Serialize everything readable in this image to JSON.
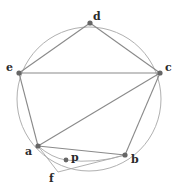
{
  "diagram": {
    "circle": {
      "cx": 89,
      "cy": 99,
      "r": 72
    },
    "points": [
      {
        "id": "d",
        "label": "d",
        "x": 90,
        "y": 23,
        "lx": 93,
        "ly": 20
      },
      {
        "id": "e",
        "label": "e",
        "x": 19,
        "y": 73,
        "lx": 6,
        "ly": 71
      },
      {
        "id": "c",
        "label": "c",
        "x": 160,
        "y": 73,
        "lx": 165,
        "ly": 71
      },
      {
        "id": "a",
        "label": "a",
        "x": 38,
        "y": 146,
        "lx": 25,
        "ly": 155
      },
      {
        "id": "b",
        "label": "b",
        "x": 125,
        "y": 155,
        "lx": 131,
        "ly": 163
      },
      {
        "id": "p",
        "label": "p",
        "x": 66,
        "y": 160,
        "lx": 71,
        "ly": 161
      },
      {
        "id": "f",
        "label": "f",
        "x": 58,
        "y": 172,
        "lx": 49,
        "ly": 182
      }
    ],
    "segments": [
      [
        "e",
        "d"
      ],
      [
        "d",
        "c"
      ],
      [
        "e",
        "c"
      ],
      [
        "e",
        "a"
      ],
      [
        "a",
        "c"
      ],
      [
        "c",
        "b"
      ],
      [
        "a",
        "b"
      ],
      [
        "a",
        "f"
      ],
      [
        "f",
        "b"
      ]
    ],
    "colors": {
      "line": "#8a8a8a",
      "circle": "#b0b0b0",
      "point": "#666666",
      "label": "#2a2a2a"
    }
  }
}
